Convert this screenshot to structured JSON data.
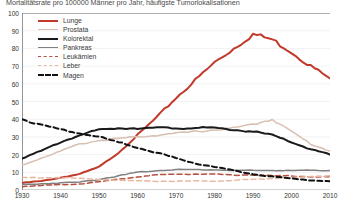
{
  "chart_data": {
    "type": "line",
    "title": "Mortalitätsrate pro 100000 Männer pro Jahr, häufigste Tumorlokalisationen",
    "xlabel": "",
    "ylabel": "",
    "xlim": [
      1930,
      2010
    ],
    "ylim": [
      0,
      100
    ],
    "xticks": [
      1930,
      1940,
      1950,
      1960,
      1970,
      1980,
      1990,
      2000,
      2010
    ],
    "yticks": [
      0,
      10,
      20,
      30,
      40,
      50,
      60,
      70,
      80,
      90,
      100
    ],
    "grid": true,
    "legend_position": "top-left",
    "x": [
      1930,
      1935,
      1940,
      1945,
      1950,
      1955,
      1960,
      1965,
      1970,
      1975,
      1980,
      1985,
      1990,
      1995,
      2000,
      2005,
      2010
    ],
    "series": [
      {
        "name": "Lunge",
        "color": "#c0392b",
        "style": "solid",
        "width": 2.0,
        "values": [
          4,
          5,
          7,
          9,
          13,
          21,
          31,
          41,
          52,
          62,
          72,
          80,
          88,
          85,
          78,
          70,
          63
        ]
      },
      {
        "name": "Prostata",
        "color": "#d9bfb2",
        "style": "solid",
        "width": 1.5,
        "values": [
          14,
          18,
          22,
          26,
          28,
          29,
          30,
          31,
          32,
          33,
          34,
          35,
          37,
          40,
          33,
          26,
          22
        ]
      },
      {
        "name": "Kolorektal",
        "color": "#1a1a1a",
        "style": "solid",
        "width": 2.0,
        "values": [
          18,
          22,
          27,
          31,
          34,
          35,
          35,
          35,
          35,
          35,
          35,
          34,
          33,
          31,
          27,
          23,
          20
        ]
      },
      {
        "name": "Pankreas",
        "color": "#808080",
        "style": "solid",
        "width": 1.5,
        "values": [
          3,
          3.5,
          4,
          4.5,
          6,
          8,
          10,
          11,
          11.5,
          11.5,
          11.5,
          11,
          11,
          11,
          11,
          11,
          11
        ]
      },
      {
        "name": "Leukämien",
        "color": "#b5503f",
        "style": "dashed",
        "width": 1.5,
        "values": [
          2,
          2.5,
          3,
          3.5,
          4.5,
          6,
          7.5,
          8.5,
          9,
          9,
          9,
          8.5,
          8.5,
          8,
          8,
          7.5,
          7.5
        ]
      },
      {
        "name": "Leber",
        "color": "#e8b9a2",
        "style": "dashed",
        "width": 1.5,
        "values": [
          7,
          7,
          7,
          6.5,
          6,
          5.5,
          5,
          5,
          5,
          5,
          5,
          5.5,
          6,
          6.5,
          7,
          7.5,
          8
        ]
      },
      {
        "name": "Magen",
        "color": "#111111",
        "style": "dashed",
        "width": 2.0,
        "values": [
          40,
          37,
          34,
          32,
          30,
          27,
          24,
          21,
          18,
          15,
          13,
          11,
          9,
          7.5,
          6.5,
          5.5,
          5
        ]
      }
    ]
  }
}
